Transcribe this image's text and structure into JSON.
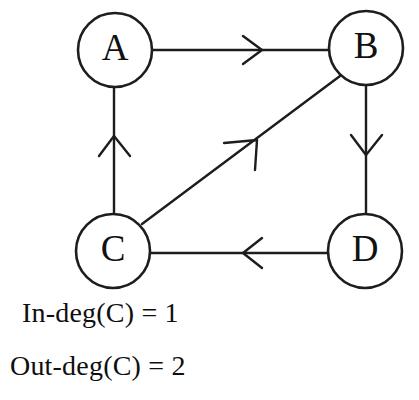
{
  "figure": {
    "background_color": "#ffffff",
    "stroke_color": "#1d1d1d"
  },
  "nodes": [
    {
      "id": "A",
      "label": "A",
      "cx": 115,
      "cy": 50,
      "r": 37
    },
    {
      "id": "B",
      "label": "B",
      "cx": 366,
      "cy": 48,
      "r": 37
    },
    {
      "id": "C",
      "label": "C",
      "cx": 113,
      "cy": 251,
      "r": 37
    },
    {
      "id": "D",
      "label": "D",
      "cx": 365,
      "cy": 251,
      "r": 37
    }
  ],
  "edges": [
    {
      "id": "a-to-b",
      "from": "A",
      "to": "B",
      "label": "A to B",
      "direction": "right"
    },
    {
      "id": "c-to-a",
      "from": "C",
      "to": "A",
      "label": "C to A",
      "direction": "up"
    },
    {
      "id": "b-to-d",
      "from": "B",
      "to": "D",
      "label": "B to D",
      "direction": "down"
    },
    {
      "id": "d-to-c",
      "from": "D",
      "to": "C",
      "label": "D to C",
      "direction": "left"
    },
    {
      "id": "c-to-b",
      "from": "C",
      "to": "B",
      "label": "C to B",
      "direction": "up-right"
    }
  ],
  "captions": {
    "in_degree": "In-deg(C) = 1",
    "out_degree": "Out-deg(C) = 2"
  }
}
